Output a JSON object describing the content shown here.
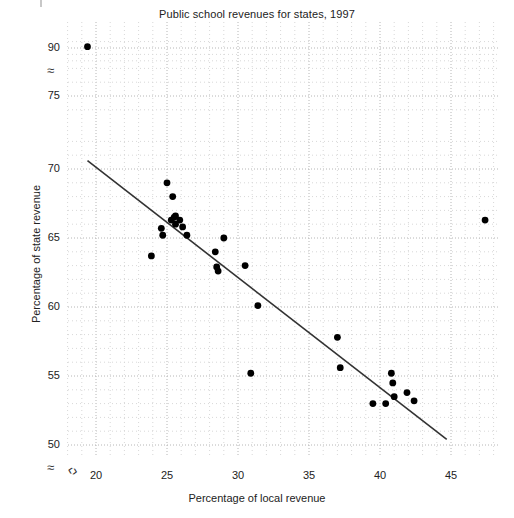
{
  "chart_data": {
    "type": "scatter",
    "title": "Public school revenues for states, 1997",
    "xlabel": "Percentage of local revenue",
    "ylabel": "Percentage of state revenue",
    "xlim": [
      18.0,
      49.0
    ],
    "ylim": [
      48.5,
      92.5
    ],
    "xticks": [
      20,
      25,
      30,
      35,
      40,
      45
    ],
    "yticks": [
      50,
      55,
      60,
      65,
      70,
      75,
      90
    ],
    "grid": true,
    "grid_style": "dotted",
    "axis_break_x": true,
    "axis_break_y": true,
    "legend": null,
    "x": [
      19.4,
      23.9,
      24.6,
      24.7,
      25.0,
      25.3,
      25.4,
      25.5,
      25.6,
      25.6,
      25.9,
      26.1,
      26.4,
      28.4,
      28.5,
      28.6,
      29.0,
      30.5,
      30.9,
      31.4,
      37.0,
      37.2,
      39.5,
      40.4,
      40.8,
      40.9,
      41.0,
      41.9,
      42.4,
      47.4
    ],
    "y": [
      90.4,
      63.7,
      65.7,
      65.2,
      69.0,
      66.3,
      68.0,
      66.5,
      66.6,
      66.0,
      66.3,
      65.8,
      65.2,
      64.0,
      62.9,
      62.6,
      65.0,
      63.0,
      55.2,
      60.1,
      57.8,
      55.6,
      53.0,
      53.0,
      55.2,
      54.5,
      53.5,
      53.8,
      53.2,
      66.3
    ],
    "n_points": 30,
    "marker": "filled-circle",
    "marker_color": "#000000",
    "fit_line": {
      "type": "linear-regression",
      "x_start": 19.4,
      "y_start": 70.6,
      "x_end": 44.7,
      "y_end": 50.4,
      "color": "#333333"
    }
  },
  "axis": {
    "y_ticks": [
      {
        "label": "90",
        "value": 90
      },
      {
        "label": "75",
        "value": 75
      },
      {
        "label": "70",
        "value": 70
      },
      {
        "label": "65",
        "value": 65
      },
      {
        "label": "60",
        "value": 60
      },
      {
        "label": "55",
        "value": 55
      },
      {
        "label": "50",
        "value": 50
      }
    ],
    "x_ticks": [
      {
        "label": "20",
        "value": 20
      },
      {
        "label": "25",
        "value": 25
      },
      {
        "label": "30",
        "value": 30
      },
      {
        "label": "35",
        "value": 35
      },
      {
        "label": "40",
        "value": 40
      },
      {
        "label": "45",
        "value": 45
      }
    ],
    "break_symbol": "≈",
    "break_symbol_x": "⦚"
  }
}
